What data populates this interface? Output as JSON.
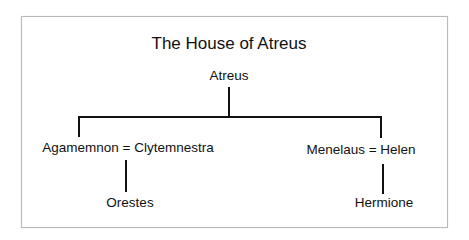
{
  "diagram": {
    "title": "The House of Atreus",
    "type": "family-tree",
    "nodes": {
      "root": "Atreus",
      "left_couple": "Agamemnon = Clytemnestra",
      "right_couple": "Menelaus = Helen",
      "left_child": "Orestes",
      "right_child": "Hermione"
    },
    "edges": [
      {
        "from": "Atreus",
        "to": "Agamemnon = Clytemnestra"
      },
      {
        "from": "Atreus",
        "to": "Menelaus = Helen"
      },
      {
        "from": "Agamemnon = Clytemnestra",
        "to": "Orestes"
      },
      {
        "from": "Menelaus = Helen",
        "to": "Hermione"
      }
    ]
  }
}
